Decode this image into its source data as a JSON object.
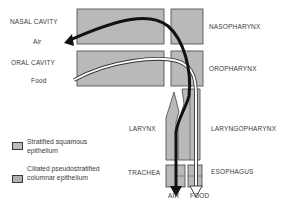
{
  "diagram": {
    "regions": {
      "nasal_cavity": "NASAL CAVITY",
      "oral_cavity": "ORAL CAVITY",
      "nasopharynx": "NASOPHARYNX",
      "oropharynx": "OROPHARYNX",
      "larynx": "LARYNX",
      "laryngopharynx": "LARYNGOPHARYNX",
      "trachea": "TRACHEA",
      "esophagus": "ESOPHAGUS"
    },
    "flows": {
      "air_in": "Air",
      "food_in": "Food",
      "air_out": "AIR",
      "food_out": "FOOD"
    },
    "legend": [
      {
        "label_line1": "Stratified squamous",
        "label_line2": "epithelium",
        "color": "#bdbdbd"
      },
      {
        "label_line1": "Ciliated pseudostratified",
        "label_line2": "columnar epithelium",
        "color": "#b0b0b0"
      }
    ],
    "colors": {
      "tissue_fill": "#b8b8b8",
      "outline": "#5a5a5a",
      "air_arrow": "#111111",
      "food_arrow": "#ffffff"
    }
  }
}
